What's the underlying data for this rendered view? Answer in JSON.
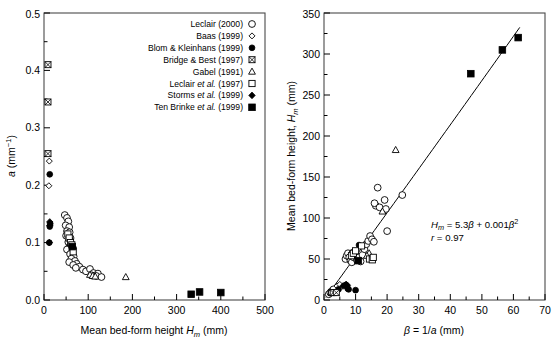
{
  "figure": {
    "background": "#ffffff",
    "line_color": "#000000",
    "panels": [
      "left",
      "right"
    ]
  },
  "legend": {
    "position": "top-right of left panel",
    "items": [
      {
        "label": "Leclair (2000)",
        "marker": "open-circle-icon"
      },
      {
        "label": "Baas (1999)",
        "marker": "open-diamond-icon"
      },
      {
        "label": "Blom & Kleinhans (1999)",
        "marker": "filled-circle-icon"
      },
      {
        "label": "Bridge & Best (1997)",
        "marker": "crossed-square-icon"
      },
      {
        "label": "Gabel (1991)",
        "marker": "open-triangle-icon"
      },
      {
        "label": "Leclair et al. (1997)",
        "marker": "open-square-icon"
      },
      {
        "label": "Storms et al. (1999)",
        "marker": "filled-diamond-icon"
      },
      {
        "label": "Ten Brinke et al. (1999)",
        "marker": "filled-square-icon"
      }
    ]
  },
  "chart_data": [
    {
      "id": "left-panel",
      "type": "scatter",
      "title": "",
      "xlabel": "Mean bed-form height Hm (mm)",
      "ylabel": "a (mm-1)",
      "xlim": [
        0,
        500
      ],
      "ylim": [
        0,
        0.5
      ],
      "xticks": [
        0,
        100,
        200,
        300,
        400,
        500
      ],
      "yticks": [
        0.0,
        0.1,
        0.2,
        0.3,
        0.4,
        0.5
      ],
      "xticklabels": [
        "0",
        "100",
        "200",
        "300",
        "400",
        "500"
      ],
      "yticklabels": [
        "0.0",
        "0.1",
        "0.2",
        "0.3",
        "0.4",
        "0.5"
      ],
      "grid": false,
      "minor_xticks": [
        50,
        150,
        250,
        350,
        450
      ],
      "minor_yticks": [
        0.05,
        0.15,
        0.25,
        0.35,
        0.45
      ],
      "series": [
        {
          "name": "Leclair (2000)",
          "marker": "open-circle",
          "points": [
            [
              47,
              0.148
            ],
            [
              52,
              0.143
            ],
            [
              55,
              0.137
            ],
            [
              49,
              0.13
            ],
            [
              57,
              0.127
            ],
            [
              52,
              0.12
            ],
            [
              58,
              0.118
            ],
            [
              50,
              0.112
            ],
            [
              60,
              0.108
            ],
            [
              55,
              0.101
            ],
            [
              62,
              0.098
            ],
            [
              57,
              0.092
            ],
            [
              52,
              0.088
            ],
            [
              64,
              0.085
            ],
            [
              59,
              0.08
            ],
            [
              67,
              0.076
            ],
            [
              62,
              0.072
            ],
            [
              70,
              0.068
            ],
            [
              57,
              0.066
            ],
            [
              74,
              0.063
            ],
            [
              66,
              0.061
            ],
            [
              80,
              0.058
            ],
            [
              72,
              0.056
            ],
            [
              88,
              0.053
            ],
            [
              95,
              0.05
            ],
            [
              104,
              0.054
            ],
            [
              112,
              0.047
            ],
            [
              122,
              0.046
            ],
            [
              118,
              0.042
            ],
            [
              130,
              0.04
            ],
            [
              108,
              0.043
            ]
          ]
        },
        {
          "name": "Baas (1999)",
          "marker": "open-diamond",
          "points": [
            [
              12,
              0.242
            ],
            [
              11,
              0.199
            ]
          ]
        },
        {
          "name": "Blom & Kleinhans (1999)",
          "marker": "filled-circle",
          "points": [
            [
              13,
              0.219
            ],
            [
              14,
              0.133
            ],
            [
              13,
              0.128
            ],
            [
              12,
              0.1
            ],
            [
              59,
              0.105
            ],
            [
              67,
              0.09
            ]
          ]
        },
        {
          "name": "Bridge & Best (1997)",
          "marker": "crossed-square",
          "points": [
            [
              9,
              0.41
            ],
            [
              9,
              0.345
            ],
            [
              9,
              0.255
            ]
          ]
        },
        {
          "name": "Gabel (1991)",
          "marker": "open-triangle",
          "points": [
            [
              104,
              0.044
            ],
            [
              110,
              0.042
            ],
            [
              116,
              0.041
            ],
            [
              185,
              0.04
            ]
          ]
        },
        {
          "name": "Leclair et al. (1997)",
          "marker": "open-square",
          "points": [
            [
              54,
              0.115
            ],
            [
              57,
              0.108
            ],
            [
              60,
              0.1
            ],
            [
              63,
              0.096
            ],
            [
              66,
              0.084
            ]
          ]
        },
        {
          "name": "Storms et al. (1999)",
          "marker": "filled-diamond",
          "points": [
            [
              13,
              0.136
            ],
            [
              13,
              0.13
            ],
            [
              12,
              0.1
            ]
          ]
        },
        {
          "name": "Ten Brinke et al. (1999)",
          "marker": "filled-square",
          "points": [
            [
              64,
              0.093
            ],
            [
              333,
              0.01
            ],
            [
              352,
              0.014
            ],
            [
              400,
              0.013
            ]
          ]
        }
      ]
    },
    {
      "id": "right-panel",
      "type": "scatter",
      "title": "",
      "xlabel": "b = 1/a (mm)",
      "ylabel": "Mean bed-form height, Hm (mm)",
      "xlim": [
        0,
        70
      ],
      "ylim": [
        0,
        350
      ],
      "xticks": [
        0,
        10,
        20,
        30,
        40,
        50,
        60,
        70
      ],
      "yticks": [
        0,
        50,
        100,
        150,
        200,
        250,
        300,
        350
      ],
      "xticklabels": [
        "0",
        "10",
        "20",
        "30",
        "40",
        "50",
        "60",
        "70"
      ],
      "yticklabels": [
        "0",
        "50",
        "100",
        "150",
        "200",
        "250",
        "300",
        "350"
      ],
      "grid": false,
      "minor_xticks": [
        5,
        15,
        25,
        35,
        45,
        55,
        65
      ],
      "minor_yticks": [
        25,
        75,
        125,
        175,
        225,
        275,
        325
      ],
      "annotation": {
        "equation": "Hm = 5.3b + 0.001b2",
        "correlation": "r = 0.97",
        "x": 34,
        "y": 115
      },
      "fit_line": {
        "label": "Hm = 5.3b + 0.001b2",
        "a": 5.3,
        "b": 0.001,
        "x_start": 0.6,
        "x_end": 62
      },
      "series": [
        {
          "name": "Leclair (2000)",
          "marker": "open-circle",
          "points": [
            [
              1.5,
              7
            ],
            [
              2.0,
              9
            ],
            [
              2.5,
              11
            ],
            [
              3.0,
              13
            ],
            [
              6.8,
              50
            ],
            [
              7.2,
              54
            ],
            [
              7.6,
              57
            ],
            [
              8.0,
              52
            ],
            [
              8.4,
              48
            ],
            [
              8.8,
              46
            ],
            [
              9.4,
              52
            ],
            [
              9.0,
              57
            ],
            [
              10.4,
              49
            ],
            [
              11.0,
              52
            ],
            [
              11.6,
              47
            ],
            [
              12.2,
              55
            ],
            [
              12.8,
              62
            ],
            [
              13.4,
              68
            ],
            [
              14.0,
              72
            ],
            [
              14.6,
              78
            ],
            [
              15.2,
              74
            ],
            [
              15.8,
              71
            ],
            [
              16.4,
              115
            ],
            [
              16.0,
              118
            ],
            [
              17.0,
              137
            ],
            [
              17.6,
              113
            ],
            [
              19.2,
              122
            ],
            [
              20.0,
              84
            ],
            [
              24.8,
              128
            ],
            [
              19.6,
              111
            ]
          ]
        },
        {
          "name": "Baas (1999)",
          "marker": "open-diamond",
          "points": [
            [
              4.1,
              17
            ],
            [
              5.0,
              19
            ]
          ]
        },
        {
          "name": "Blom & Kleinhans (1999)",
          "marker": "filled-circle",
          "points": [
            [
              4.6,
              13
            ],
            [
              7.5,
              14
            ],
            [
              7.8,
              13
            ],
            [
              10.0,
              12
            ],
            [
              9.5,
              59
            ],
            [
              11.1,
              67
            ]
          ]
        },
        {
          "name": "Bridge & Best (1997)",
          "marker": "crossed-square",
          "points": [
            [
              2.4,
              9
            ],
            [
              2.9,
              9
            ],
            [
              3.9,
              9
            ]
          ]
        },
        {
          "name": "Gabel (1991)",
          "marker": "open-triangle",
          "points": [
            [
              22.7,
              183
            ],
            [
              18.5,
              108
            ],
            [
              14.3,
              57
            ],
            [
              13.6,
              54
            ]
          ]
        },
        {
          "name": "Leclair et al. (1997)",
          "marker": "open-square",
          "points": [
            [
              8.7,
              54
            ],
            [
              9.3,
              57
            ],
            [
              10.0,
              60
            ],
            [
              14.4,
              50
            ],
            [
              15.3,
              49
            ],
            [
              15.6,
              52
            ],
            [
              11.9,
              66
            ]
          ]
        },
        {
          "name": "Storms et al. (1999)",
          "marker": "filled-diamond",
          "points": [
            [
              6.5,
              18
            ],
            [
              7.0,
              19
            ],
            [
              7.4,
              18
            ],
            [
              6.0,
              17
            ]
          ]
        },
        {
          "name": "Ten Brinke et al. (1999)",
          "marker": "filled-square",
          "points": [
            [
              10.8,
              48
            ],
            [
              46.5,
              276
            ],
            [
              56.5,
              305
            ],
            [
              61.5,
              320
            ]
          ]
        }
      ]
    }
  ]
}
